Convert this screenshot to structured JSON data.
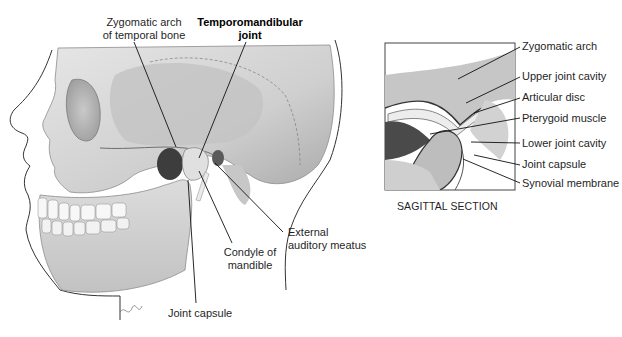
{
  "figure": {
    "skull_view": {
      "labels": {
        "zygomatic_arch_temporal": [
          "Zygomatic arch",
          "of temporal bone"
        ],
        "tmj": [
          "Temporomandibular",
          "joint"
        ],
        "condyle": [
          "Condyle of",
          "mandible"
        ],
        "external_meatus": [
          "External",
          "auditory meatus"
        ],
        "joint_capsule": "Joint capsule"
      }
    },
    "sagittal_view": {
      "labels": [
        "Zygomatic arch",
        "Upper joint cavity",
        "Articular disc",
        "Pterygoid muscle",
        "Lower joint cavity",
        "Joint capsule",
        "Synovial membrane"
      ],
      "caption": "SAGITTAL SECTION"
    },
    "colors": {
      "bone_light": "#d9d9d9",
      "bone_mid": "#bdbdbd",
      "bone_dark": "#8a8a8a",
      "muscle": "#4a4a4a",
      "leader": "#111111"
    }
  }
}
